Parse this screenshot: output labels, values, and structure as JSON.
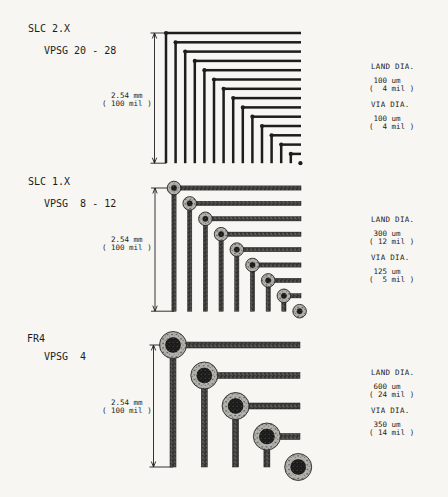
{
  "colors": {
    "paper": "#f7f6f2",
    "ink": "#1d1d1d"
  },
  "sections": [
    {
      "title": "SLC 2.X",
      "subtitle": "VPSG 20 - 28",
      "pitch_label": "  2.54 mm\n( 100 mil )",
      "land_dia_heading": "LAND DIA.",
      "land_dia_value": " 100 um\n(  4 mil )",
      "via_dia_heading": "VIA DIA.",
      "via_dia_value": " 100 um\n(  4 mil )",
      "diagram": {
        "style": "dot",
        "via_count": 15,
        "origin_x": 166,
        "origin_y": 33,
        "step_x": 9.6,
        "step_y": 9.3,
        "right_edge_x": 301,
        "trace_width": 2.5,
        "dot_radius": 2.1,
        "dim_line_x": 154.5
      }
    },
    {
      "title": "SLC 1.X",
      "subtitle": "VPSG  8 - 12",
      "pitch_label": "  2.54 mm\n( 100 mil )",
      "land_dia_heading": "LAND DIA.",
      "land_dia_value": " 300 um\n( 12 mil )",
      "via_dia_heading": "VIA DIA.",
      "via_dia_value": " 125 um\n(  5 mil )",
      "diagram": {
        "style": "donut",
        "via_count": 9,
        "origin_x": 174,
        "origin_y": 188,
        "step_x": 15.7,
        "step_y": 15.4,
        "right_edge_x": 301,
        "trace_width": 4.2,
        "land_radius": 6.8,
        "via_radius": 3.4,
        "dim_line_x": 155
      }
    },
    {
      "title": "FR4",
      "subtitle": "VPSG  4",
      "pitch_label": "  2.54 mm\n( 100 mil )",
      "land_dia_heading": "LAND DIA.",
      "land_dia_value": " 600 um\n( 24 mil )",
      "via_dia_heading": "VIA DIA.",
      "via_dia_value": " 350 um\n( 14 mil )",
      "diagram": {
        "style": "donut",
        "via_count": 5,
        "origin_x": 173,
        "origin_y": 345,
        "step_x": 31.3,
        "step_y": 30.5,
        "right_edge_x": 300,
        "trace_width": 6,
        "land_radius": 13.5,
        "via_radius": 8.3,
        "dim_line_x": 153.5
      }
    }
  ]
}
